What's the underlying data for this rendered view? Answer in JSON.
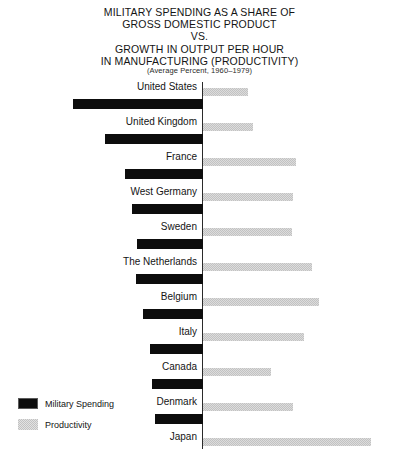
{
  "chart_data": {
    "type": "bar",
    "title": "MILITARY SPENDING AS A SHARE OF GROSS DOMESTIC PRODUCT VS. GROWTH IN OUTPUT PER HOUR IN MANUFACTURING (PRODUCTIVITY)",
    "title_lines": [
      "MILITARY SPENDING AS A SHARE OF",
      "GROSS DOMESTIC PRODUCT",
      "VS.",
      "GROWTH IN OUTPUT PER HOUR",
      "IN MANUFACTURING (PRODUCTIVITY)"
    ],
    "subtitle": "(Average Percent, 1960–1979)",
    "orientation": "horizontal-diverging",
    "xlabel": "",
    "ylabel": "",
    "grid": false,
    "legend_position": "bottom-left",
    "categories": [
      "United States",
      "United Kingdom",
      "France",
      "West Germany",
      "Sweden",
      "The Netherlands",
      "Belgium",
      "Italy",
      "Canada",
      "Denmark",
      "Japan"
    ],
    "series": [
      {
        "name": "Military Spending",
        "direction": "left",
        "color": "#0d0d0d",
        "values": [
          7.1,
          5.6,
          4.5,
          3.9,
          3.6,
          3.7,
          3.3,
          2.9,
          2.8,
          2.6,
          0.9
        ],
        "pixel_lengths": [
          130,
          98,
          78,
          71,
          66,
          67,
          60,
          53,
          51,
          48,
          16
        ]
      },
      {
        "name": "Productivity",
        "direction": "right",
        "color": "#dcdcdc",
        "values": [
          2.5,
          2.8,
          5.2,
          5.0,
          5.0,
          6.1,
          6.5,
          5.6,
          3.8,
          5.0,
          9.4
        ],
        "pixel_lengths": [
          45,
          50,
          93,
          90,
          89,
          109,
          116,
          101,
          68,
          90,
          168
        ]
      }
    ]
  },
  "legend": {
    "items": [
      {
        "label": "Military Spending",
        "swatch": "black-solid"
      },
      {
        "label": "Productivity",
        "swatch": "gray-halftone"
      }
    ]
  }
}
